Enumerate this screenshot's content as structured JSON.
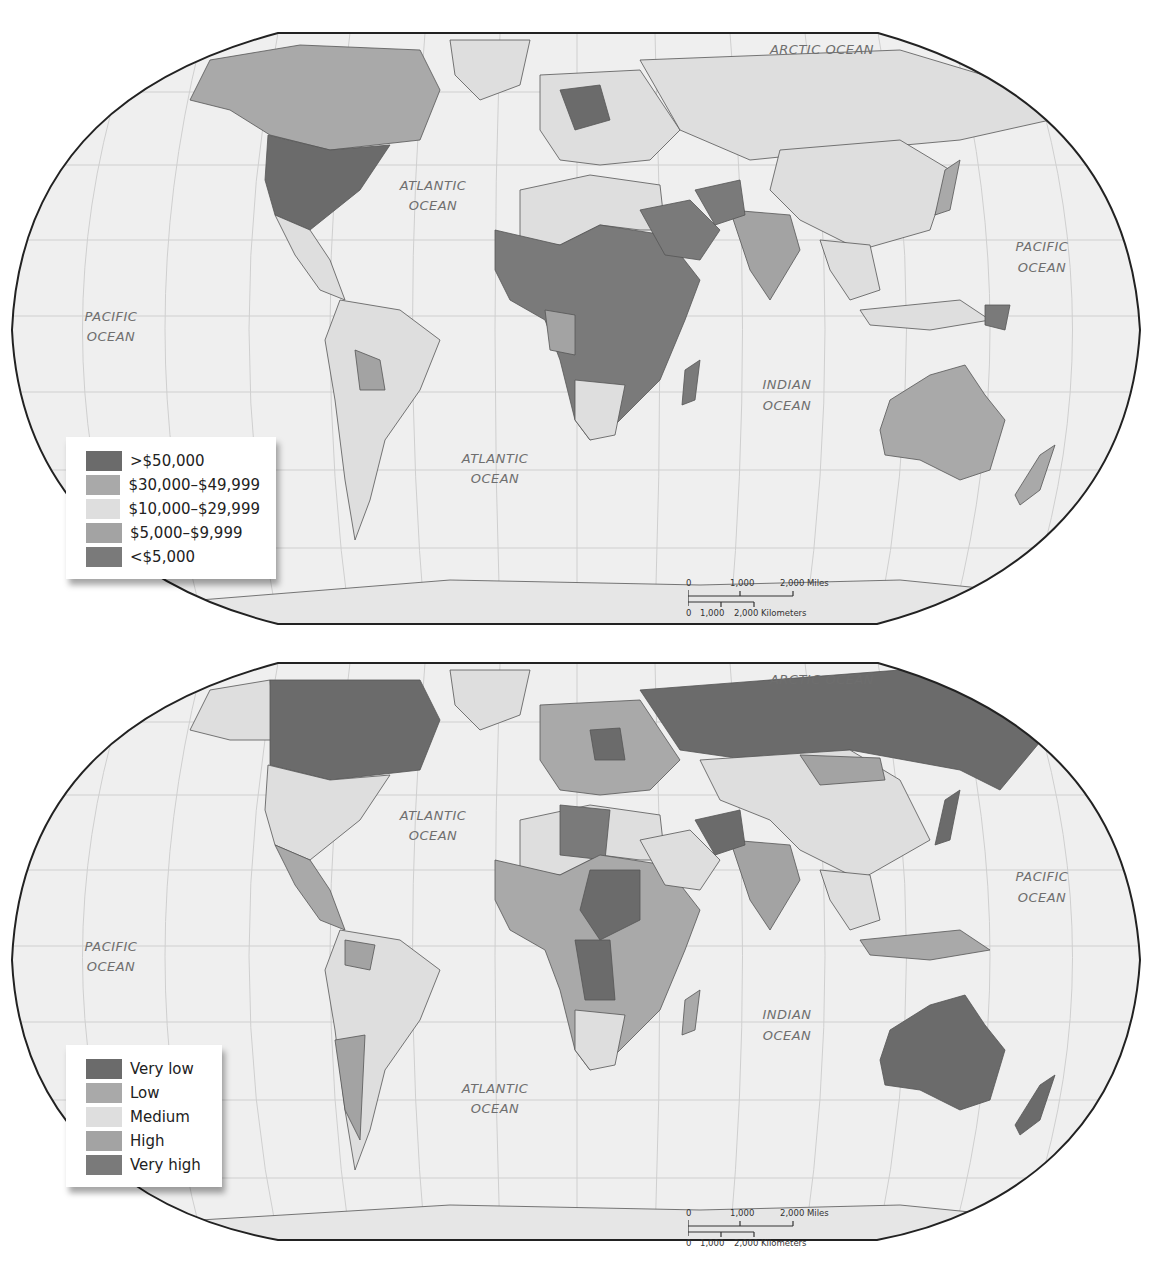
{
  "colors": {
    "ocean": "#efefef",
    "grid": "#cfcfcf",
    "border": "#222222",
    "class_1": "#6b6b6b",
    "class_2": "#a9a9a9",
    "class_3": "#dedede",
    "class_4": "#a3a3a3",
    "class_5": "#7a7a7a"
  },
  "maps": [
    {
      "name": "income-map",
      "ocean_labels": {
        "arctic": "ARCTIC OCEAN",
        "atlantic_north_1": "ATLANTIC",
        "atlantic_north_2": "OCEAN",
        "atlantic_south_1": "ATLANTIC",
        "atlantic_south_2": "OCEAN",
        "pacific_west_1": "PACIFIC",
        "pacific_west_2": "OCEAN",
        "pacific_east_1": "PACIFIC",
        "pacific_east_2": "OCEAN",
        "indian_1": "INDIAN",
        "indian_2": "OCEAN"
      },
      "legend": [
        {
          "label": ">$50,000",
          "color": "#6b6b6b"
        },
        {
          "label": "$30,000–$49,999",
          "color": "#a9a9a9"
        },
        {
          "label": "$10,000–$29,999",
          "color": "#dedede"
        },
        {
          "label": "$5,000–$9,999",
          "color": "#a3a3a3"
        },
        {
          "label": "<$5,000",
          "color": "#7a7a7a"
        }
      ],
      "scale": {
        "miles": [
          "0",
          "1,000",
          "2,000 Miles"
        ],
        "km": [
          "0",
          "1,000",
          "2,000 Kilometers"
        ]
      }
    },
    {
      "name": "rating-map",
      "ocean_labels": {
        "arctic": "ARCTIC OCEAN",
        "atlantic_north_1": "ATLANTIC",
        "atlantic_north_2": "OCEAN",
        "atlantic_south_1": "ATLANTIC",
        "atlantic_south_2": "OCEAN",
        "pacific_west_1": "PACIFIC",
        "pacific_west_2": "OCEAN",
        "pacific_east_1": "PACIFIC",
        "pacific_east_2": "OCEAN",
        "indian_1": "INDIAN",
        "indian_2": "OCEAN"
      },
      "legend": [
        {
          "label": "Very low",
          "color": "#6b6b6b"
        },
        {
          "label": "Low",
          "color": "#a9a9a9"
        },
        {
          "label": "Medium",
          "color": "#dedede"
        },
        {
          "label": "High",
          "color": "#a3a3a3"
        },
        {
          "label": "Very high",
          "color": "#7a7a7a"
        }
      ],
      "scale": {
        "miles": [
          "0",
          "1,000",
          "2,000 Miles"
        ],
        "km": [
          "0",
          "1,000",
          "2,000 Kilometers"
        ]
      }
    }
  ]
}
